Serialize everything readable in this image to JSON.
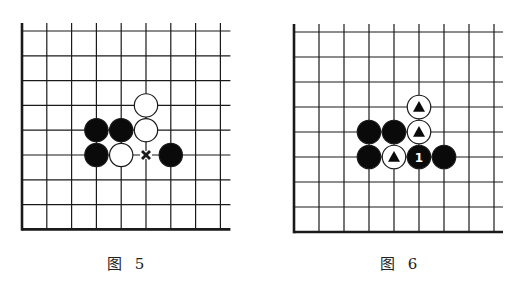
{
  "diagrams": [
    {
      "id": "fig5",
      "caption": "图 5",
      "origin": [
        22,
        31
      ],
      "spacing": 24.8,
      "cols": 9,
      "rows": 9,
      "right_extension": 10,
      "top_extension": 8,
      "caption_pos": [
        107,
        252
      ],
      "stones": [
        {
          "col": 5,
          "row": 3,
          "color": "white",
          "mark": ""
        },
        {
          "col": 3,
          "row": 4,
          "color": "black",
          "mark": ""
        },
        {
          "col": 4,
          "row": 4,
          "color": "black",
          "mark": ""
        },
        {
          "col": 5,
          "row": 4,
          "color": "white",
          "mark": ""
        },
        {
          "col": 3,
          "row": 5,
          "color": "black",
          "mark": ""
        },
        {
          "col": 4,
          "row": 5,
          "color": "white",
          "mark": ""
        },
        {
          "col": 6,
          "row": 5,
          "color": "black",
          "mark": ""
        }
      ],
      "points": [
        {
          "col": 5,
          "row": 5,
          "mark": "x"
        }
      ]
    },
    {
      "id": "fig6",
      "caption": "图 6",
      "origin": [
        294,
        32
      ],
      "spacing": 25,
      "cols": 9,
      "rows": 9,
      "right_extension": 9,
      "top_extension": 8,
      "caption_pos": [
        380,
        252
      ],
      "stones": [
        {
          "col": 5,
          "row": 3,
          "color": "white",
          "mark": "triangle"
        },
        {
          "col": 3,
          "row": 4,
          "color": "black",
          "mark": ""
        },
        {
          "col": 4,
          "row": 4,
          "color": "black",
          "mark": ""
        },
        {
          "col": 5,
          "row": 4,
          "color": "white",
          "mark": "triangle"
        },
        {
          "col": 3,
          "row": 5,
          "color": "black",
          "mark": ""
        },
        {
          "col": 4,
          "row": 5,
          "color": "white",
          "mark": "triangle"
        },
        {
          "col": 5,
          "row": 5,
          "color": "black",
          "mark": "1"
        },
        {
          "col": 6,
          "row": 5,
          "color": "black",
          "mark": ""
        }
      ],
      "points": []
    }
  ],
  "colors": {
    "line": "#1a1a1a",
    "black_stone": "#0a0a0a",
    "white_stone": "#ffffff",
    "background": "#ffffff"
  }
}
